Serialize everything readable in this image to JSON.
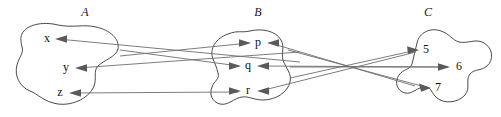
{
  "diagram": {
    "kind": "set-mapping-diagram",
    "title_visible": false,
    "background_color": "#ffffff",
    "outline_color": "#4a4a4a",
    "arrow_color": "#6e6e6e",
    "text_color": "#111111",
    "sets": [
      {
        "id": "A",
        "label": "A",
        "label_x": 85,
        "label_y": 14,
        "elements": [
          {
            "id": "x",
            "label": "x",
            "x": 47,
            "y": 39
          },
          {
            "id": "y",
            "label": "y",
            "x": 66,
            "y": 68
          },
          {
            "id": "z",
            "label": "z",
            "x": 60,
            "y": 93
          }
        ]
      },
      {
        "id": "B",
        "label": "B",
        "label_x": 258,
        "label_y": 14,
        "elements": [
          {
            "id": "p",
            "label": "p",
            "x": 258,
            "y": 43
          },
          {
            "id": "q",
            "label": "q",
            "x": 248,
            "y": 66
          },
          {
            "id": "r",
            "label": "r",
            "x": 248,
            "y": 91
          }
        ]
      },
      {
        "id": "C",
        "label": "C",
        "label_x": 428,
        "label_y": 14,
        "elements": [
          {
            "id": "5",
            "label": "5",
            "x": 426,
            "y": 50
          },
          {
            "id": "6",
            "label": "6",
            "x": 459,
            "y": 67
          },
          {
            "id": "7",
            "label": "7",
            "x": 438,
            "y": 88
          }
        ]
      }
    ],
    "arrows": [
      {
        "id": "arrow-to-x",
        "from": "B-side",
        "to": "x",
        "direction": "left",
        "head_x": 56,
        "head_y": 39
      },
      {
        "id": "arrow-to-y",
        "from": "B-side",
        "to": "y",
        "direction": "left",
        "head_x": 76,
        "head_y": 68
      },
      {
        "id": "arrow-to-z",
        "from": "B-side",
        "to": "z",
        "direction": "left",
        "head_x": 70,
        "head_y": 93
      },
      {
        "id": "arrow-to-p",
        "from": "A",
        "to": "p",
        "direction": "right",
        "head_x": 250,
        "head_y": 43
      },
      {
        "id": "arrow-to-q",
        "from": "A",
        "to": "q",
        "direction": "right",
        "head_x": 240,
        "head_y": 66
      },
      {
        "id": "arrow-to-r",
        "from": "A",
        "to": "r",
        "direction": "right",
        "head_x": 240,
        "head_y": 91
      },
      {
        "id": "arrow-to-p-from-c",
        "from": "C",
        "to": "p",
        "direction": "left",
        "head_x": 268,
        "head_y": 43
      },
      {
        "id": "arrow-to-q-from-c",
        "from": "C",
        "to": "q",
        "direction": "left",
        "head_x": 258,
        "head_y": 66
      },
      {
        "id": "arrow-to-r-from-c",
        "from": "C",
        "to": "r",
        "direction": "left",
        "head_x": 258,
        "head_y": 91
      },
      {
        "id": "arrow-to-5",
        "from": "B",
        "to": "5",
        "direction": "right",
        "head_x": 418,
        "head_y": 50
      },
      {
        "id": "arrow-to-6",
        "from": "B",
        "to": "6",
        "direction": "right",
        "head_x": 449,
        "head_y": 67
      },
      {
        "id": "arrow-to-7",
        "from": "B",
        "to": "7",
        "direction": "right",
        "head_x": 430,
        "head_y": 88
      }
    ]
  }
}
